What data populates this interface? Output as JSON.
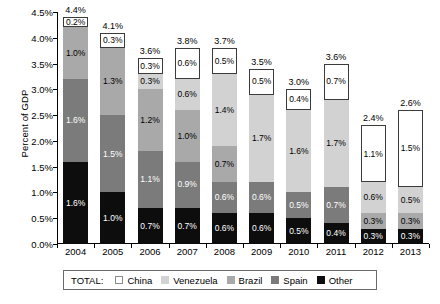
{
  "chart_data": {
    "type": "bar",
    "subtype": "stacked-bar",
    "title": "",
    "xlabel": "",
    "ylabel": "Percent of GDP",
    "ylim": [
      0,
      4.5
    ],
    "ytick_labels": [
      "0.0%",
      "0.5%",
      "1.0%",
      "1.5%",
      "2.0%",
      "2.5%",
      "3.0%",
      "3.5%",
      "4.0%",
      "4.5%"
    ],
    "ytick_values": [
      0,
      0.5,
      1.0,
      1.5,
      2.0,
      2.5,
      3.0,
      3.5,
      4.0,
      4.5
    ],
    "grid": false,
    "legend_position": "bottom",
    "legend_prefix": "TOTAL:",
    "categories": [
      "2004",
      "2005",
      "2006",
      "2007",
      "2008",
      "2009",
      "2010",
      "2011",
      "2012",
      "2013"
    ],
    "series": [
      {
        "name": "China",
        "color": "#ffffff",
        "values": [
          0.2,
          0.3,
          0.3,
          0.6,
          0.5,
          0.5,
          0.4,
          0.7,
          1.1,
          1.5
        ]
      },
      {
        "name": "Venezuela",
        "color": "#d2d2d2",
        "values": [
          0.0,
          0.0,
          0.3,
          0.6,
          1.4,
          1.7,
          1.6,
          1.7,
          0.6,
          0.5
        ]
      },
      {
        "name": "Brazil",
        "color": "#a9a9a9",
        "values": [
          1.0,
          1.3,
          1.2,
          1.0,
          0.7,
          0.0,
          0.0,
          0.0,
          0.3,
          0.3
        ]
      },
      {
        "name": "Spain",
        "color": "#7b7b7b",
        "values": [
          1.6,
          1.5,
          1.1,
          0.9,
          0.6,
          0.6,
          0.5,
          0.7,
          0.0,
          0.0
        ]
      },
      {
        "name": "Other",
        "color": "#0d0d0d",
        "values": [
          1.6,
          1.0,
          0.7,
          0.7,
          0.6,
          0.6,
          0.5,
          0.4,
          0.3,
          0.3
        ]
      }
    ],
    "totals": [
      4.4,
      4.1,
      3.6,
      3.8,
      3.7,
      3.5,
      3.0,
      3.6,
      2.4,
      2.6
    ],
    "total_labels": [
      "4.4%",
      "4.1%",
      "3.6%",
      "3.8%",
      "3.7%",
      "3.5%",
      "3.0%",
      "3.6%",
      "2.4%",
      "2.6%"
    ],
    "segment_labels": [
      {
        "year": "2004",
        "labels": {
          "China": "0.2%",
          "Venezuela": "",
          "Brazil": "1.0%",
          "Spain": "1.6%",
          "Other": "1.6%"
        }
      },
      {
        "year": "2005",
        "labels": {
          "China": "0.3%",
          "Venezuela": "",
          "Brazil": "1.3%",
          "Spain": "1.5%",
          "Other": "1.0%"
        }
      },
      {
        "year": "2006",
        "labels": {
          "China": "0.3%",
          "Venezuela": "0.3%",
          "Brazil": "1.2%",
          "Spain": "1.1%",
          "Other": "0.7%"
        }
      },
      {
        "year": "2007",
        "labels": {
          "China": "0.6%",
          "Venezuela": "0.6%",
          "Brazil": "1.0%",
          "Spain": "0.9%",
          "Other": "0.7%"
        }
      },
      {
        "year": "2008",
        "labels": {
          "China": "0.5%",
          "Venezuela": "1.4%",
          "Brazil": "0.7%",
          "Spain": "0.6%",
          "Other": "0.6%"
        }
      },
      {
        "year": "2009",
        "labels": {
          "China": "0.5%",
          "Venezuela": "1.7%",
          "Brazil": "",
          "Spain": "0.6%",
          "Other": "0.6%"
        }
      },
      {
        "year": "2010",
        "labels": {
          "China": "0.4%",
          "Venezuela": "1.6%",
          "Brazil": "",
          "Spain": "0.5%",
          "Other": "0.5%"
        }
      },
      {
        "year": "2011",
        "labels": {
          "China": "0.7%",
          "Venezuela": "1.7%",
          "Brazil": "",
          "Spain": "0.7%",
          "Other": "0.4%"
        }
      },
      {
        "year": "2012",
        "labels": {
          "China": "1.1%",
          "Venezuela": "0.6%",
          "Brazil": "0.3%",
          "Spain": "",
          "Other": "0.3%"
        }
      },
      {
        "year": "2013",
        "labels": {
          "China": "1.5%",
          "Venezuela": "0.5%",
          "Brazil": "0.3%",
          "Spain": "",
          "Other": "0.3%"
        }
      }
    ]
  },
  "legend": {
    "total_label": "TOTAL:",
    "items": [
      {
        "label": "China",
        "key": "China"
      },
      {
        "label": "Venezuela",
        "key": "Venezuela"
      },
      {
        "label": "Brazil",
        "key": "Brazil"
      },
      {
        "label": "Spain",
        "key": "Spain"
      },
      {
        "label": "Other",
        "key": "Other"
      }
    ]
  }
}
